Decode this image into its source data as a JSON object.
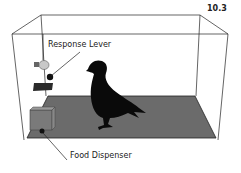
{
  "figure": {
    "number": "10.3",
    "labels": {
      "response_lever": "Response Lever",
      "food_dispenser": "Food Dispenser"
    },
    "colors": {
      "outline": "#222222",
      "floor": "#6b6b6b",
      "silhouette": "#0a0a0a",
      "lever": "#2a2a2a",
      "bulb": "#c8c8c8",
      "dispenser": "#7a7a7a"
    }
  }
}
